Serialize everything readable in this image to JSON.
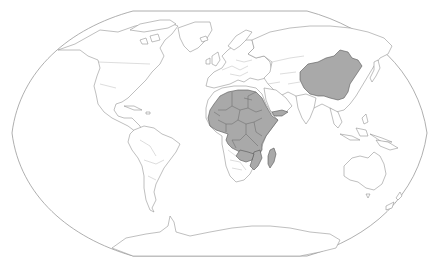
{
  "map": {
    "projection": "Winkel Tripel (world)",
    "background_color": "#ffffff",
    "outline_color": "#9a9a9a",
    "land_fill": "#ffffff",
    "coast_color": "#8a8a8a",
    "highlight_fill": "#a9a9a9",
    "highlight_border": "#555555",
    "highlighted_regions": [
      "China",
      "Mauritania",
      "Mali",
      "Niger",
      "Chad",
      "Sudan",
      "Algeria-south",
      "Libya",
      "Egypt",
      "Senegal",
      "Guinea",
      "Sierra Leone",
      "Liberia",
      "Cote d'Ivoire",
      "Burkina Faso",
      "Ghana",
      "Togo",
      "Benin",
      "Nigeria",
      "Cameroon",
      "Central African Republic",
      "South Sudan",
      "Ethiopia",
      "Eritrea",
      "Somalia",
      "Kenya",
      "Gabon",
      "Republic of the Congo",
      "DR Congo",
      "Uganda",
      "Rwanda",
      "Burundi",
      "Tanzania",
      "Angola-north",
      "Zambia",
      "Malawi",
      "Mozambique",
      "Zimbabwe",
      "Madagascar",
      "Yemen"
    ]
  }
}
